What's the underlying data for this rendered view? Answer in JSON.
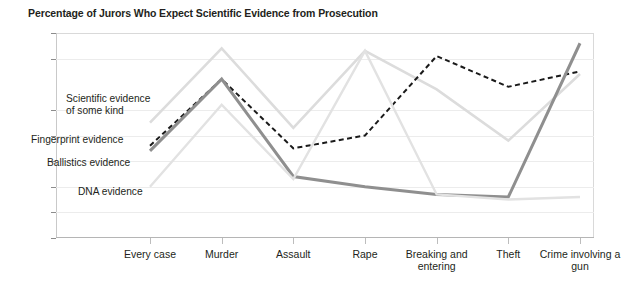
{
  "chart_data": {
    "type": "line",
    "title": "Percentage of Jurors Who Expect Scientific Evidence from Prosecution",
    "xlabel": "",
    "ylabel": "",
    "ylim": [
      0,
      80
    ],
    "ytick_step": 10,
    "yticks": [
      "80",
      "70",
      "50",
      "40",
      "30",
      "20",
      "10",
      "0"
    ],
    "ytick_values": [
      80,
      70,
      50,
      40,
      30,
      20,
      10,
      0
    ],
    "grid": true,
    "legend": "inline-annotations",
    "categories": [
      "Every\ncase",
      "Murder",
      "Assault",
      "Rape",
      "Breaking\nand\nentering",
      "Theft",
      "Crime\ninvolving\na gun"
    ],
    "series": [
      {
        "name": "Scientific evidence\nof some kind",
        "label": "Scientific evidence\nof some kind",
        "color": "#dcdcdc",
        "style": "solid",
        "width": 2.6,
        "values": [
          45,
          74,
          43,
          73,
          58,
          38,
          64
        ]
      },
      {
        "name": "Fingerprint evidence",
        "label": "Fingerprint evidence",
        "color": "#1a1a1a",
        "style": "dashed",
        "width": 2.0,
        "values": [
          36,
          62,
          35,
          40,
          71,
          59,
          65
        ]
      },
      {
        "name": "Ballistics evidence",
        "label": "Ballistics evidence",
        "color": "#8f8f8f",
        "style": "solid",
        "width": 3.0,
        "values": [
          34,
          62,
          24,
          20,
          17,
          16,
          76
        ]
      },
      {
        "name": "DNA evidence",
        "label": "DNA evidence",
        "color": "#e2e2e2",
        "style": "solid",
        "width": 2.4,
        "values": [
          20,
          52,
          23,
          73,
          17,
          15,
          16
        ]
      }
    ]
  },
  "annotations": {
    "scientific": "Scientific evidence\nof some kind",
    "fingerprint": "Fingerprint evidence",
    "ballistics": "Ballistics evidence",
    "dna": "DNA evidence"
  }
}
